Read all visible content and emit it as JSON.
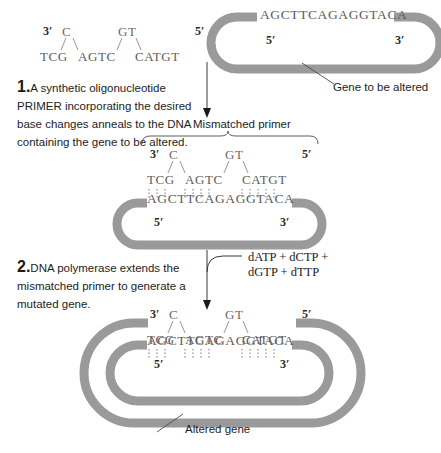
{
  "figure": {
    "title_hidden": "Site-directed mutagenesis using a mismatched primer",
    "colors": {
      "dna_gray": "#9a9a9a",
      "sequence_gray": "#5d5d5d",
      "text_black": "#1d1d1d",
      "line_gray": "#6f6f6f"
    }
  },
  "panel_top": {
    "primer": {
      "label_3prime": "3′",
      "label_5prime": "5′",
      "raised_base_1": "C",
      "raised_base_2": "GT",
      "sequence_segments": [
        "TCG",
        "AGTC",
        "CATGT"
      ],
      "sequence_full": "TCG  AGTC   CATGT"
    },
    "plus_symbol": "+",
    "gene_loop": {
      "sequence": "AGCTTCAGAGGTACA",
      "label_5prime": "5′",
      "label_3prime": "3′",
      "callout": "Gene to be altered"
    }
  },
  "step1": {
    "number": "1.",
    "text": "A synthetic oligonucleotide PRIMER incorporating the desired base changes anneals to the DNA containing the gene to be altered."
  },
  "panel_middle": {
    "brace_label": "Mismatched primer",
    "primer": {
      "label_3prime": "3′",
      "label_5prime": "5′",
      "raised_base_1": "C",
      "raised_base_2": "GT",
      "sequence_segments": [
        "TCG",
        "AGTC",
        "CATGT"
      ]
    },
    "bond_groups": [
      3,
      4,
      5
    ],
    "template": {
      "sequence": "AGCTTCAGAGGTACA",
      "label_5prime": "5′",
      "label_3prime": "3′"
    }
  },
  "step2": {
    "number": "2.",
    "text": "DNA polymerase extends the mismatched primer to generate a mutated gene.",
    "reagents": "dATP + dCTP +\ndGTP + dTTP"
  },
  "panel_bottom": {
    "primer": {
      "label_3prime": "3′",
      "label_5prime": "5′",
      "raised_base_1": "C",
      "raised_base_2": "GT",
      "sequence_segments": [
        "TCG",
        "AGTC",
        "CATGT"
      ]
    },
    "bond_groups": [
      3,
      4,
      5
    ],
    "template": {
      "sequence": "AGCTTCAGAGGTACA",
      "label_5prime": "5′",
      "label_3prime": "3′"
    },
    "callout": "Altered gene"
  }
}
